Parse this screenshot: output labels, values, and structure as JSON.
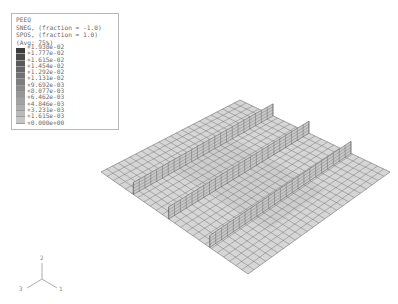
{
  "legend": {
    "variable": "PEEQ",
    "section_neg": "SNEG, (fraction = -1.0)",
    "section_pos": "SPOS, (fraction = 1.0)",
    "averaging": "(Avg: 75%)",
    "values": [
      "+1.938e-02",
      "+1.777e-02",
      "+1.615e-02",
      "+1.454e-02",
      "+1.292e-02",
      "+1.131e-02",
      "+9.692e-03",
      "+8.077e-03",
      "+6.462e-03",
      "+4.846e-03",
      "+3.231e-03",
      "+1.615e-03",
      "+0.000e+00"
    ],
    "colors": [
      "#3a3a3a",
      "#4a4a4a",
      "#5a5a5a",
      "#666666",
      "#727272",
      "#7e7e7e",
      "#8a8a8a",
      "#969696",
      "#a2a2a2",
      "#aeaeae",
      "#bababa",
      "#c6c6c6",
      "#d2d2d2"
    ]
  },
  "model": {
    "plate_corners": {
      "top": [
        240,
        100
      ],
      "right": [
        390,
        172
      ],
      "bottom": [
        248,
        274
      ],
      "left": [
        101,
        172
      ]
    },
    "grid_divisions": 24,
    "stiffener_positions": [
      0.22,
      0.46,
      0.74
    ],
    "stiffener_height": 12,
    "plate_fill": "#d6d6d6",
    "grid_color": "#6e6e6e",
    "stiffener_fill": "#c8c8c8"
  },
  "triad": {
    "axis_1": "1",
    "axis_2": "2",
    "axis_3": "3"
  }
}
